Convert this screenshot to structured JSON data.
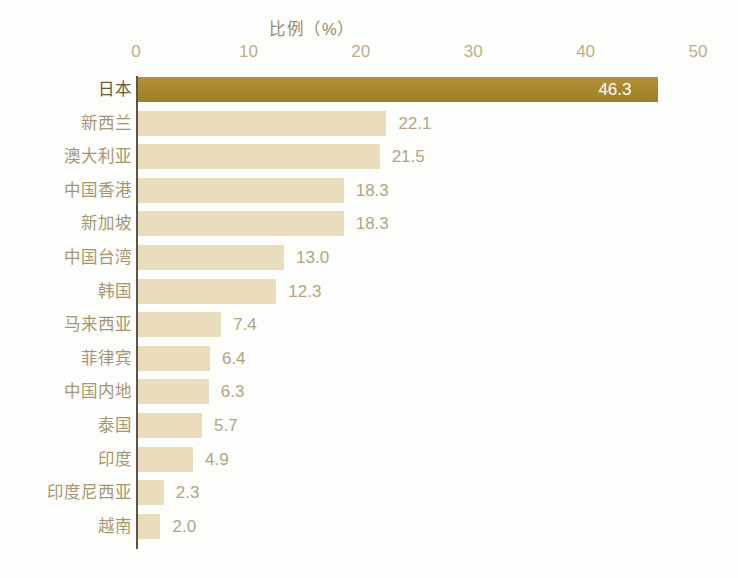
{
  "chart_data": {
    "type": "bar",
    "orientation": "horizontal",
    "title": "比例（%）",
    "xlabel": "",
    "ylabel": "",
    "xlim": [
      0,
      50
    ],
    "xticks": [
      "0",
      "10",
      "20",
      "30",
      "40",
      "50"
    ],
    "grid": false,
    "legend": null,
    "categories": [
      "日本",
      "新西兰",
      "澳大利亚",
      "中国香港",
      "新加坡",
      "中国台湾",
      "韩国",
      "马来西亚",
      "菲律宾",
      "中国内地",
      "泰国",
      "印度",
      "印度尼西亚",
      "越南"
    ],
    "values": [
      46.3,
      22.1,
      21.5,
      18.3,
      18.3,
      13.0,
      12.3,
      7.4,
      6.4,
      6.3,
      5.7,
      4.9,
      2.3,
      2.0
    ],
    "value_labels": [
      "46.3",
      "22.1",
      "21.5",
      "18.3",
      "18.3",
      "13.0",
      "12.3",
      "7.4",
      "6.4",
      "6.3",
      "5.7",
      "4.9",
      "2.3",
      "2.0"
    ],
    "highlighted_index": 0,
    "colors": {
      "bar": "#e9ddbe",
      "bar_highlight": "#a98b35",
      "axis": "#5c5546",
      "tick_text": "#bcae8d",
      "category_text": "#a6966f",
      "category_text_highlight": "#6b5b38",
      "value_text": "#b3a582",
      "value_text_inside": "#ffffff",
      "title_text": "#988a6a",
      "background": "#fdfdfb"
    }
  }
}
